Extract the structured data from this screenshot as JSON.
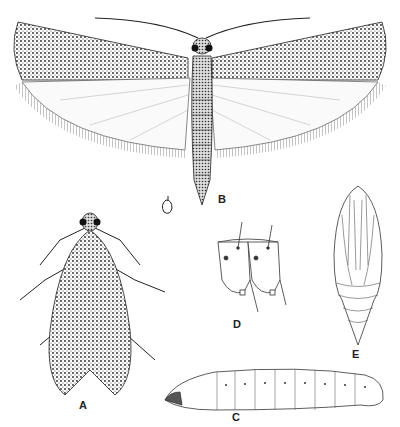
{
  "plate": {
    "figures": [
      {
        "id": "A",
        "label": "A",
        "subject": "adult moth, wings folded (resting)"
      },
      {
        "id": "B",
        "label": "B",
        "subject": "adult moth, wings spread"
      },
      {
        "id": "C",
        "label": "C",
        "subject": "larva (caterpillar), lateral view"
      },
      {
        "id": "D",
        "label": "D",
        "subject": "larval abdominal segments detail"
      },
      {
        "id": "E",
        "label": "E",
        "subject": "pupa, ventral view"
      }
    ],
    "scale_mark": "♂",
    "colors": {
      "ink": "#1a1a1a",
      "paper": "#ffffff",
      "shade": "#555555"
    }
  }
}
